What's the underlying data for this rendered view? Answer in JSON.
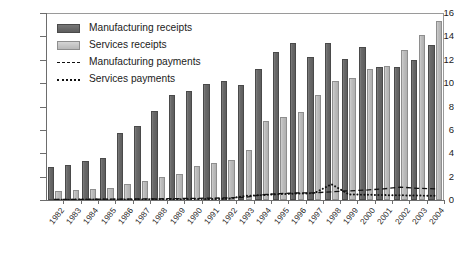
{
  "chart_data": {
    "type": "bar",
    "title": "",
    "subtitle": "",
    "xlabel": "",
    "ylabel": "",
    "ylim": [
      0,
      16
    ],
    "ytick_labels": [
      "0",
      "2",
      "4",
      "6",
      "8",
      "10",
      "12",
      "14",
      "16"
    ],
    "ytick_values": [
      0,
      2,
      4,
      6,
      8,
      10,
      12,
      14,
      16
    ],
    "grid": false,
    "legend_position": "top-left",
    "categories": [
      "1982",
      "1983",
      "1984",
      "1985",
      "1986",
      "1987",
      "1988",
      "1989",
      "1990",
      "1991",
      "1992",
      "1993",
      "1994",
      "1995",
      "1996",
      "1997",
      "1998",
      "1999",
      "2000",
      "2001",
      "2002",
      "2003",
      "2004"
    ],
    "series": [
      {
        "name": "Manufacturing receipts",
        "kind": "bar",
        "color": "#5e5e5e",
        "values": [
          2.8,
          3.0,
          3.3,
          3.6,
          5.7,
          6.3,
          7.6,
          9.0,
          9.3,
          9.9,
          10.2,
          9.8,
          11.2,
          12.7,
          13.4,
          12.2,
          13.4,
          12.1,
          13.1,
          11.4,
          11.4,
          12.0,
          13.3
        ]
      },
      {
        "name": "Services receipts",
        "kind": "bar",
        "color": "#b8b8b8",
        "values": [
          0.75,
          0.85,
          0.95,
          1.05,
          1.4,
          1.6,
          2.0,
          2.25,
          2.95,
          3.2,
          3.4,
          4.3,
          6.8,
          7.1,
          7.5,
          9.0,
          10.2,
          10.4,
          11.2,
          11.5,
          12.8,
          14.1,
          15.3
        ]
      },
      {
        "name": "Manufacturing payments",
        "kind": "line",
        "style": "dashed",
        "color": "#111111",
        "values": [
          0.05,
          0.05,
          0.06,
          0.07,
          0.08,
          0.09,
          0.1,
          0.12,
          0.14,
          0.16,
          0.18,
          0.22,
          0.45,
          0.55,
          0.6,
          0.62,
          0.7,
          0.78,
          0.85,
          0.95,
          1.1,
          1.0,
          0.95
        ]
      },
      {
        "name": "Services payments",
        "kind": "line",
        "style": "dotted",
        "color": "#111111",
        "values": [
          0.03,
          0.03,
          0.04,
          0.04,
          0.05,
          0.05,
          0.06,
          0.07,
          0.08,
          0.09,
          0.1,
          0.35,
          0.42,
          0.5,
          0.55,
          0.58,
          1.35,
          0.48,
          0.45,
          0.42,
          0.4,
          0.38,
          0.36
        ]
      }
    ]
  },
  "legend": {
    "items": [
      {
        "label": "Manufacturing receipts",
        "marker": "swatch-mfg"
      },
      {
        "label": "Services receipts",
        "marker": "swatch-svc"
      },
      {
        "label": "Manufacturing payments",
        "marker": "line-dashed"
      },
      {
        "label": "Services payments",
        "marker": "line-dotted"
      }
    ]
  },
  "colors": {
    "manufacturing_receipts": "#5e5e5e",
    "services_receipts": "#b8b8b8",
    "payments_line": "#111111",
    "axis": "#6d6d6d",
    "text": "#1b1b1b",
    "background": "#ffffff"
  }
}
